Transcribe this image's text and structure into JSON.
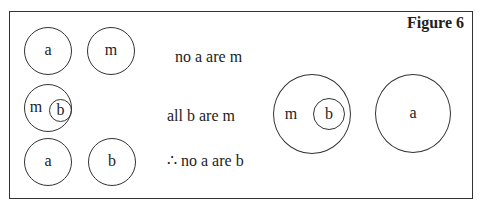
{
  "figure": {
    "title": "Figure 6",
    "border_color": "#333333",
    "background": "#ffffff"
  },
  "left_panel": {
    "row1": {
      "circles": [
        {
          "label": "a"
        },
        {
          "label": "m"
        }
      ],
      "statement": "no a are m"
    },
    "row2": {
      "outer_label": "m",
      "inner_label": "b",
      "statement": "all b are m"
    },
    "row3": {
      "circles": [
        {
          "label": "a"
        },
        {
          "label": "b"
        }
      ],
      "statement": "∴ no a are b"
    }
  },
  "right_panel": {
    "outer_label": "m",
    "inner_label": "b",
    "separate_label": "a"
  }
}
